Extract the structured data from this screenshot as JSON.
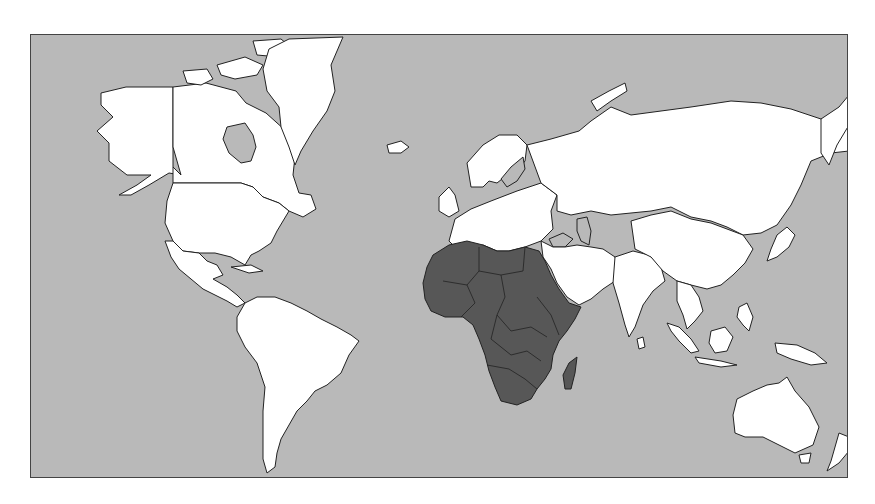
{
  "map": {
    "projection": "mercator-world",
    "highlighted_region": "Africa",
    "colors": {
      "ocean": "#b9b9b9",
      "land": "#ffffff",
      "highlight": "#575757",
      "inland_water": "#b9b9b9",
      "outline": "#222222"
    },
    "frame": {
      "x": 30,
      "y": 34,
      "width": 818,
      "height": 444
    },
    "regions": [
      {
        "name": "alaska",
        "fill": "land",
        "points": "70,58 95,52 142,52 142,132 150,140 138,138 118,150 100,160 88,160 106,150 120,140 96,140 78,126 78,108 66,96 82,82 70,70"
      },
      {
        "name": "canada",
        "fill": "land",
        "points": "142,52 175,48 205,56 215,68 235,78 255,96 265,112 262,140 268,158 280,160 285,174 272,182 258,176 248,168 232,162 222,152 210,148 196,148 178,148 142,148 142,132 150,140 142,112"
      },
      {
        "name": "hudson-bay",
        "fill": "inland_water",
        "points": "196,92 214,88 222,100 225,112 220,126 210,128 198,118 192,104"
      },
      {
        "name": "arctic-islands-1",
        "fill": "land",
        "points": "152,36 176,34 182,44 170,50 156,48"
      },
      {
        "name": "arctic-islands-2",
        "fill": "land",
        "points": "186,30 214,22 232,30 226,40 204,44 190,40"
      },
      {
        "name": "arctic-islands-3",
        "fill": "land",
        "points": "222,6 250,4 262,14 248,22 226,20"
      },
      {
        "name": "arctic-islands-4",
        "fill": "land",
        "points": "240,30 262,32 268,52 276,66 266,70 252,58 242,44"
      },
      {
        "name": "greenland",
        "fill": "land",
        "points": "258,4 312,2 300,30 304,56 296,76 282,96 270,116 264,130 258,112 250,92 248,72 236,56 232,34 238,14"
      },
      {
        "name": "iceland",
        "fill": "land",
        "points": "356,110 370,106 378,112 370,118 358,118"
      },
      {
        "name": "usa",
        "fill": "land",
        "points": "142,148 178,148 196,148 210,148 222,152 232,162 248,168 258,176 252,186 246,196 240,208 228,216 220,220 214,230 200,222 184,218 168,218 152,216 142,206 134,188 136,166"
      },
      {
        "name": "mexico-central-america",
        "fill": "land",
        "points": "134,206 142,206 152,216 168,218 176,226 186,230 192,240 182,244 196,252 206,260 214,268 206,272 196,266 184,260 172,254 160,244 148,234 140,222"
      },
      {
        "name": "cuba",
        "fill": "land",
        "points": "200,232 220,230 232,236 218,238"
      },
      {
        "name": "south-america",
        "fill": "land",
        "points": "214,268 226,262 244,262 260,268 276,276 290,284 306,292 320,300 328,306 318,320 310,338 296,350 284,356 276,366 266,376 258,390 250,404 246,418 244,432 236,438 232,424 232,400 232,376 234,352 226,328 214,312 206,296 206,282"
      },
      {
        "name": "europe-scandinavia",
        "fill": "land",
        "points": "436,128 452,110 468,100 486,100 496,110 494,126 486,136 476,140 466,148 458,146 452,152 440,152"
      },
      {
        "name": "baltic",
        "fill": "inland_water",
        "points": "480,132 492,122 494,134 486,146 476,152 470,144"
      },
      {
        "name": "british-isles",
        "fill": "land",
        "points": "408,162 418,152 424,160 428,176 418,182 408,176"
      },
      {
        "name": "europe-main",
        "fill": "land",
        "points": "424,184 440,174 460,166 486,156 510,148 526,160 520,176 522,194 510,206 494,212 478,216 466,216 452,210 440,214 426,214 418,206"
      },
      {
        "name": "russia-asia",
        "fill": "land",
        "points": "496,110 520,104 548,96 560,86 580,72 600,80 630,76 660,72 700,66 730,68 760,74 790,84 818,90 818,116 800,118 780,126 770,150 760,170 746,190 730,198 712,200 696,192 680,186 660,182 640,172 620,176 600,178 580,180 560,176 540,180 526,176 526,160 510,148"
      },
      {
        "name": "novaya-zemlya",
        "fill": "land",
        "points": "560,66 578,56 594,48 596,56 580,66 566,76"
      },
      {
        "name": "kamchatka",
        "fill": "land",
        "points": "790,84 808,72 818,60 818,90 806,110 798,130 790,118"
      },
      {
        "name": "caspian",
        "fill": "inland_water",
        "points": "546,184 556,182 560,196 558,210 550,206 546,196"
      },
      {
        "name": "black-sea",
        "fill": "inland_water",
        "points": "518,204 532,198 542,204 534,212 522,212"
      },
      {
        "name": "middle-east",
        "fill": "land",
        "points": "510,206 522,212 534,212 546,210 560,212 572,214 584,222 590,236 584,246 572,254 560,264 548,270 536,262 526,248 520,234 512,222"
      },
      {
        "name": "india",
        "fill": "land",
        "points": "584,222 602,216 618,220 630,232 634,246 622,256 612,270 604,292 598,302 594,290 588,268 582,248"
      },
      {
        "name": "sri-lanka",
        "fill": "land",
        "points": "606,304 612,302 614,312 608,314"
      },
      {
        "name": "china",
        "fill": "land",
        "points": "600,186 620,180 640,176 660,184 680,188 696,194 712,200 722,214 714,228 702,240 690,250 676,254 660,250 646,246 632,236 620,222 604,214"
      },
      {
        "name": "se-asia",
        "fill": "land",
        "points": "646,246 660,250 668,262 672,276 664,286 656,294 652,280 646,266"
      },
      {
        "name": "japan",
        "fill": "land",
        "points": "746,200 756,192 764,200 758,212 746,222 736,226 740,214"
      },
      {
        "name": "sumatra",
        "fill": "land",
        "points": "636,288 648,292 660,304 668,316 660,318 648,306 640,296"
      },
      {
        "name": "borneo",
        "fill": "land",
        "points": "680,296 694,292 702,302 696,316 684,318 678,308"
      },
      {
        "name": "java",
        "fill": "land",
        "points": "664,322 690,326 706,330 690,332 668,328"
      },
      {
        "name": "philippines",
        "fill": "land",
        "points": "708,272 716,268 722,282 718,296 712,290 706,282"
      },
      {
        "name": "new-guinea",
        "fill": "land",
        "points": "744,308 766,310 784,318 796,328 780,330 760,324 746,318"
      },
      {
        "name": "australia",
        "fill": "land",
        "points": "706,364 722,356 736,350 748,348 756,342 764,356 778,372 788,392 782,410 764,418 748,410 732,402 714,402 704,398 702,380"
      },
      {
        "name": "tasmania",
        "fill": "land",
        "points": "768,420 780,418 778,428 770,428"
      },
      {
        "name": "new-zealand",
        "fill": "land",
        "points": "808,398 818,402 818,416 808,428 796,436 800,426"
      },
      {
        "name": "africa",
        "fill": "highlight",
        "points": "402,220 418,210 436,206 452,210 466,216 478,216 494,212 508,216 514,226 520,240 528,254 538,268 550,272 544,284 536,296 528,306 522,320 520,334 514,344 506,354 500,364 486,370 470,366 464,352 458,336 454,320 448,304 442,290 432,282 414,282 400,276 394,264 392,248 396,232"
      },
      {
        "name": "madagascar",
        "fill": "highlight",
        "points": "538,328 546,322 544,338 540,354 534,354 532,340"
      }
    ],
    "africa_borders": [
      "M 412,246 L 436,250 L 448,236 L 470,240 L 492,236",
      "M 436,250 L 444,268 L 430,282",
      "M 470,240 L 474,262 L 466,280 L 480,296 L 500,292 L 516,302",
      "M 448,236 L 448,212",
      "M 492,236 L 494,212",
      "M 466,280 L 460,304 L 480,320 L 496,316 L 510,326",
      "M 456,330 L 478,334 L 494,344 L 506,354",
      "M 506,262 L 520,280 L 528,300"
    ]
  }
}
